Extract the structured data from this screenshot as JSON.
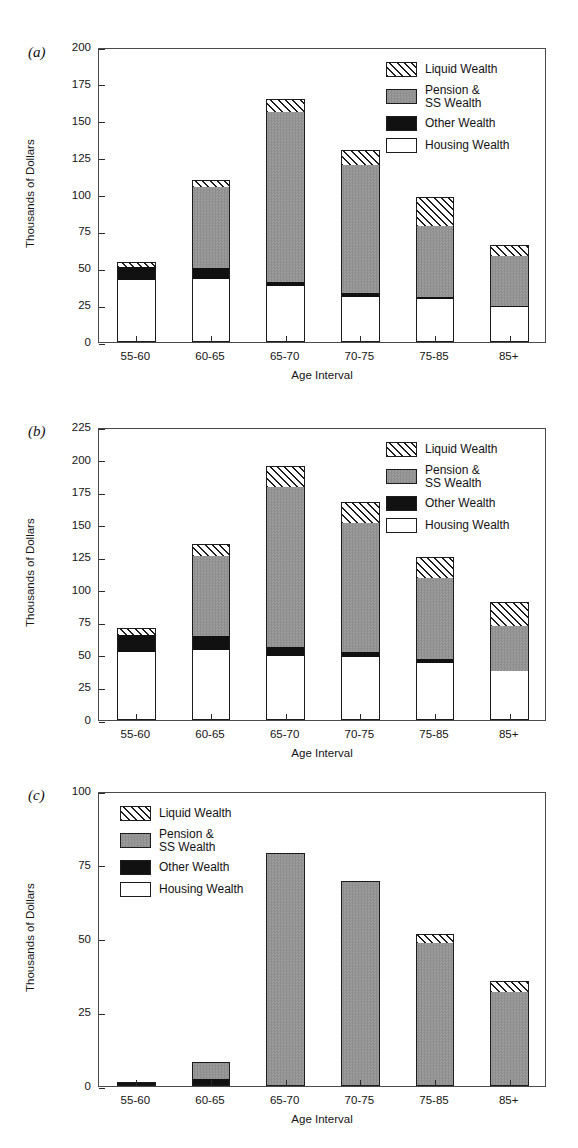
{
  "figure": {
    "panels": [
      {
        "id": "a",
        "label": "(a)",
        "legend_position": "inside-top-right"
      },
      {
        "id": "b",
        "label": "(b)",
        "legend_position": "inside-top-right"
      },
      {
        "id": "c",
        "label": "(c)",
        "legend_position": "inside-top-left"
      }
    ],
    "legend_entries": [
      {
        "key": "liquid",
        "label": "Liquid Wealth",
        "swatch": "diagonal-hatch",
        "color": "#ffffff"
      },
      {
        "key": "pension",
        "label": "Pension &\nSS Wealth",
        "swatch": "gray-stipple",
        "color": "#959595"
      },
      {
        "key": "other",
        "label": "Other Wealth",
        "swatch": "solid-black",
        "color": "#111111"
      },
      {
        "key": "housing",
        "label": "Housing Wealth",
        "swatch": "white-open",
        "color": "#ffffff"
      }
    ]
  },
  "chart_data": [
    {
      "type": "bar",
      "panel": "a",
      "title": "",
      "stacked": true,
      "xlabel": "Age Interval",
      "ylabel": "Thousands of Dollars",
      "categories": [
        "55-60",
        "60-65",
        "65-70",
        "70-75",
        "75-85",
        "85+"
      ],
      "ylim": [
        0,
        200
      ],
      "yticks": [
        0,
        25,
        50,
        75,
        100,
        125,
        150,
        175,
        200
      ],
      "grid": false,
      "legend": [
        "Liquid Wealth",
        "Pension & SS Wealth",
        "Other Wealth",
        "Housing Wealth"
      ],
      "series": [
        {
          "name": "Housing Wealth",
          "values": [
            42,
            43,
            38,
            30.5,
            29,
            23.5
          ]
        },
        {
          "name": "Other Wealth",
          "values": [
            9,
            7,
            3,
            2.5,
            1.5,
            1
          ]
        },
        {
          "name": "Pension & SS Wealth",
          "values": [
            0,
            55,
            115,
            87,
            48,
            34
          ]
        },
        {
          "name": "Liquid Wealth",
          "values": [
            3,
            5,
            9,
            10,
            19.5,
            7
          ]
        }
      ],
      "totals": [
        54,
        110,
        165,
        130,
        98,
        65.5
      ]
    },
    {
      "type": "bar",
      "panel": "b",
      "title": "",
      "stacked": true,
      "xlabel": "Age Interval",
      "ylabel": "Thousands of Dollars",
      "categories": [
        "55-60",
        "60-65",
        "65-70",
        "70-75",
        "75-85",
        "85+"
      ],
      "ylim": [
        0,
        225
      ],
      "yticks": [
        0,
        25,
        50,
        75,
        100,
        125,
        150,
        175,
        200,
        225
      ],
      "grid": false,
      "legend": [
        "Liquid Wealth",
        "Pension & SS Wealth",
        "Other Wealth",
        "Housing Wealth"
      ],
      "series": [
        {
          "name": "Housing Wealth",
          "values": [
            52,
            53.5,
            49.5,
            48.5,
            44,
            38
          ]
        },
        {
          "name": "Other Wealth",
          "values": [
            13,
            11,
            6.5,
            4,
            3,
            0
          ]
        },
        {
          "name": "Pension & SS Wealth",
          "values": [
            0,
            61.5,
            123,
            99,
            62,
            34
          ]
        },
        {
          "name": "Liquid Wealth",
          "values": [
            6,
            9,
            16,
            16,
            16,
            19
          ]
        }
      ],
      "totals": [
        71,
        135,
        195,
        167.5,
        125,
        91
      ]
    },
    {
      "type": "bar",
      "panel": "c",
      "title": "",
      "stacked": true,
      "xlabel": "Age Interval",
      "ylabel": "Thousands of Dollars",
      "categories": [
        "55-60",
        "60-65",
        "65-70",
        "70-75",
        "75-85",
        "85+"
      ],
      "ylim": [
        0,
        100
      ],
      "yticks": [
        0,
        25,
        50,
        75,
        100
      ],
      "grid": false,
      "legend": [
        "Liquid Wealth",
        "Pension & SS Wealth",
        "Other Wealth",
        "Housing Wealth"
      ],
      "series": [
        {
          "name": "Housing Wealth",
          "values": [
            0,
            0,
            0,
            0,
            0,
            0
          ]
        },
        {
          "name": "Other Wealth",
          "values": [
            1.5,
            2.5,
            0,
            0,
            0,
            0
          ]
        },
        {
          "name": "Pension & SS Wealth",
          "values": [
            0,
            5.5,
            79,
            69.5,
            48.5,
            32
          ]
        },
        {
          "name": "Liquid Wealth",
          "values": [
            0,
            0,
            0,
            0,
            3,
            3.5
          ]
        }
      ],
      "totals": [
        1.5,
        8,
        79,
        69.5,
        51.5,
        35.5
      ]
    }
  ]
}
